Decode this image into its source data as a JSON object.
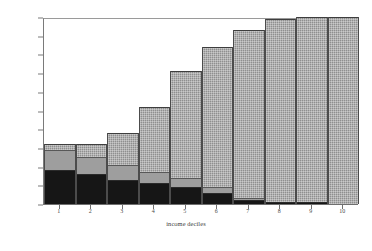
{
  "chart_data": {
    "type": "bar",
    "stacked": true,
    "title": "",
    "xlabel": "income deciles",
    "ylabel": "",
    "categories": [
      "1",
      "2",
      "3",
      "4",
      "5",
      "6",
      "7",
      "8",
      "9",
      "10"
    ],
    "ytick_labels": [
      "0%",
      "10%",
      "20%",
      "30%",
      "40%",
      "50%",
      "60%",
      "70%",
      "80%",
      "90%",
      "100%"
    ],
    "ytick_values": [
      0,
      10,
      20,
      30,
      40,
      50,
      60,
      70,
      80,
      90,
      100
    ],
    "ylim": [
      0,
      100
    ],
    "xlim_categories": 10,
    "grid": false,
    "legend": "none",
    "series": [
      {
        "name": "lower segment",
        "style": "solid-black",
        "color": "#161616",
        "values": [
          18,
          16,
          13,
          11,
          9,
          6,
          2,
          1,
          1,
          0
        ]
      },
      {
        "name": "middle segment",
        "style": "solid-gray",
        "color": "#9e9e9e",
        "values": [
          11,
          9,
          8,
          6,
          5,
          3,
          1,
          0,
          0,
          0
        ]
      },
      {
        "name": "upper segment",
        "style": "hatched-gray",
        "color": "#8f8f8f",
        "values": [
          3,
          7,
          17,
          35,
          57,
          75,
          90,
          98,
          99,
          100
        ]
      }
    ],
    "stack_totals": [
      32,
      32,
      38,
      52,
      71,
      84,
      93,
      99,
      100,
      100
    ]
  },
  "axes": {
    "x_tick_label_1": "1",
    "x_tick_label_2": "2",
    "x_tick_label_3": "3",
    "x_tick_label_4": "4",
    "x_tick_label_5": "5",
    "x_tick_label_6": "6",
    "x_tick_label_7": "7",
    "x_tick_label_8": "8",
    "x_tick_label_9": "9",
    "x_tick_label_10": "10"
  },
  "colors": {
    "low": "#161616",
    "mid": "#9e9e9e",
    "high": "#8f8f8f",
    "background": "#ffffff",
    "axis": "#6f6f6f",
    "text": "#3c3c3c"
  }
}
